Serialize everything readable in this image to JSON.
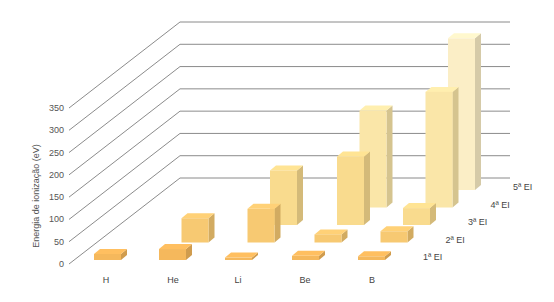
{
  "chart_data": {
    "type": "bar",
    "subtype": "3d-bar",
    "title": "",
    "xlabel": "",
    "ylabel": "Energia de ionização (eV)",
    "ylim": [
      0,
      350
    ],
    "yticks": [
      0,
      50,
      100,
      150,
      200,
      250,
      300,
      350
    ],
    "grid": true,
    "categories": [
      "H",
      "He",
      "Li",
      "Be",
      "B"
    ],
    "series": [
      {
        "name": "1ª EI",
        "values": [
          13.6,
          24.6,
          5.4,
          9.3,
          8.3
        ],
        "color": "#F5B85C"
      },
      {
        "name": "2ª EI",
        "values": [
          null,
          54.4,
          75.6,
          18.2,
          25.2
        ],
        "color": "#F7C972"
      },
      {
        "name": "3ª EI",
        "values": [
          null,
          null,
          122.4,
          153.9,
          37.9
        ],
        "color": "#F9DB8E"
      },
      {
        "name": "4ª EI",
        "values": [
          null,
          null,
          null,
          217.7,
          259.4
        ],
        "color": "#FAE6A8"
      },
      {
        "name": "5ª EI",
        "values": [
          null,
          null,
          null,
          null,
          340.2
        ],
        "color": "#FBEEC6"
      }
    ],
    "legend_position": "right-diagonal"
  }
}
